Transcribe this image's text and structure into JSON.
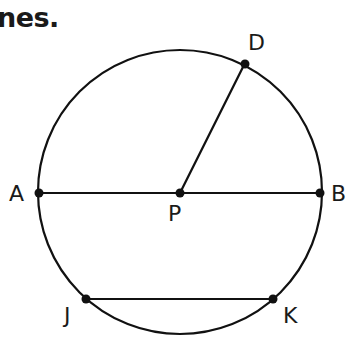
{
  "heading": {
    "text": "nes."
  },
  "diagram": {
    "circle": {
      "cx": 180,
      "cy": 192,
      "r": 142,
      "stroke": "#111111"
    },
    "points": [
      {
        "id": "A",
        "label": "A",
        "x": 39,
        "y": 193
      },
      {
        "id": "P",
        "label": "P",
        "x": 180,
        "y": 193
      },
      {
        "id": "B",
        "label": "B",
        "x": 320,
        "y": 193
      },
      {
        "id": "D",
        "label": "D",
        "x": 245,
        "y": 63
      },
      {
        "id": "J",
        "label": "J",
        "x": 86,
        "y": 299
      },
      {
        "id": "K",
        "label": "K",
        "x": 273,
        "y": 299
      }
    ],
    "segments": [
      {
        "name": "diameter-AB",
        "from": "A",
        "to": "B"
      },
      {
        "name": "radius-PD",
        "from": "P",
        "to": "D"
      },
      {
        "name": "chord-JK",
        "from": "J",
        "to": "K"
      }
    ],
    "labels": {
      "A": "A",
      "P": "P",
      "B": "B",
      "D": "D",
      "J": "J",
      "K": "K"
    }
  }
}
